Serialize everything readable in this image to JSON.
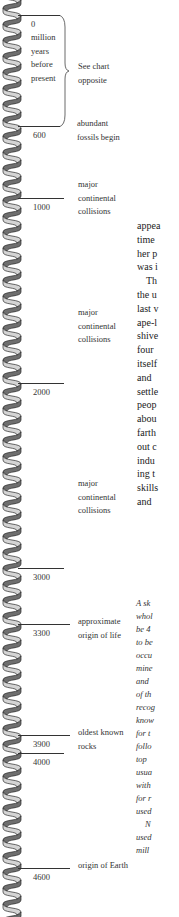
{
  "timeline": {
    "unit_label": [
      "million",
      "years",
      "before",
      "present"
    ],
    "brace_note": [
      "See chart",
      "opposite"
    ],
    "ticks": [
      {
        "year": "0",
        "tick_y": 15,
        "event": []
      },
      {
        "year": "600",
        "tick_y": 126,
        "event": [
          "abundant",
          "fossils begin"
        ]
      },
      {
        "year": "1000",
        "tick_y": 198,
        "event": [
          "major",
          "continental",
          "collisions"
        ]
      },
      {
        "year": "2000",
        "tick_y": 383,
        "event": []
      },
      {
        "year": "3000",
        "tick_y": 568,
        "event": []
      },
      {
        "year": "3300",
        "tick_y": 624,
        "event": [
          "approximate",
          "origin of life"
        ]
      },
      {
        "year": "3900",
        "tick_y": 735,
        "event": [
          "oldest known",
          "rocks"
        ]
      },
      {
        "year": "4000",
        "tick_y": 753,
        "event": []
      },
      {
        "year": "4600",
        "tick_y": 868,
        "event": [
          "origin of Earth"
        ]
      }
    ],
    "standalone_events": [
      {
        "lines": [
          "major",
          "continental",
          "collisions"
        ],
        "y": 306
      },
      {
        "lines": [
          "major",
          "continental",
          "collisions"
        ],
        "y": 477
      }
    ]
  },
  "body_text": {
    "lines": [
      "appea",
      "time",
      "her p",
      "was i",
      "Th",
      "the u",
      "last v",
      "ape-l",
      "shive",
      "four",
      "itself",
      "and",
      "settle",
      "peop",
      "abou",
      "farth",
      "out c",
      "indu",
      "ing t",
      "skills",
      "and"
    ]
  },
  "caption_text": {
    "lines": [
      "A sk",
      "whol",
      "be 4",
      "to be",
      "occu",
      "mine",
      "and",
      "of th",
      "recog",
      "know",
      "for t",
      "follo",
      "top",
      "usua",
      "with",
      "for r",
      "used",
      "N",
      "used",
      "mill"
    ]
  },
  "colors": {
    "helix_light": "#d4d4d4",
    "helix_dark": "#6e6e6e",
    "helix_outline": "#2b2b2b",
    "tick": "#333333"
  }
}
